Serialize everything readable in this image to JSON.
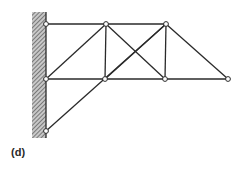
{
  "figure": {
    "label": "(d)",
    "colors": {
      "line": "#2a2a2a",
      "node_fill": "#ffffff",
      "hatch": "#555555"
    },
    "wall": {
      "x": 32,
      "y": 12,
      "width": 14,
      "height": 126
    },
    "nodes": [
      {
        "id": "A",
        "x": 46,
        "y": 24
      },
      {
        "id": "B",
        "x": 106,
        "y": 24
      },
      {
        "id": "C",
        "x": 166,
        "y": 24
      },
      {
        "id": "D",
        "x": 46,
        "y": 79
      },
      {
        "id": "E",
        "x": 105,
        "y": 79
      },
      {
        "id": "F",
        "x": 165,
        "y": 79
      },
      {
        "id": "G",
        "x": 228,
        "y": 79
      },
      {
        "id": "H",
        "x": 46,
        "y": 131
      }
    ],
    "members": [
      [
        "A",
        "B"
      ],
      [
        "B",
        "C"
      ],
      [
        "D",
        "E"
      ],
      [
        "E",
        "F"
      ],
      [
        "F",
        "G"
      ],
      [
        "D",
        "B"
      ],
      [
        "B",
        "E"
      ],
      [
        "B",
        "F"
      ],
      [
        "E",
        "C"
      ],
      [
        "C",
        "F"
      ],
      [
        "C",
        "G"
      ],
      [
        "H",
        "C"
      ]
    ]
  }
}
